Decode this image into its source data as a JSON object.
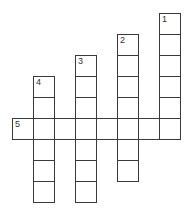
{
  "puzzle": {
    "cell_size": 21,
    "origin": {
      "x": 12,
      "y": 13
    },
    "words": [
      {
        "number": "1",
        "direction": "down",
        "col": 7,
        "row": 0,
        "length": 6
      },
      {
        "number": "2",
        "direction": "down",
        "col": 5,
        "row": 1,
        "length": 7
      },
      {
        "number": "3",
        "direction": "down",
        "col": 3,
        "row": 2,
        "length": 7
      },
      {
        "number": "4",
        "direction": "down",
        "col": 1,
        "row": 3,
        "length": 6
      },
      {
        "number": "5",
        "direction": "across",
        "col": 0,
        "row": 5,
        "length": 8
      }
    ]
  }
}
